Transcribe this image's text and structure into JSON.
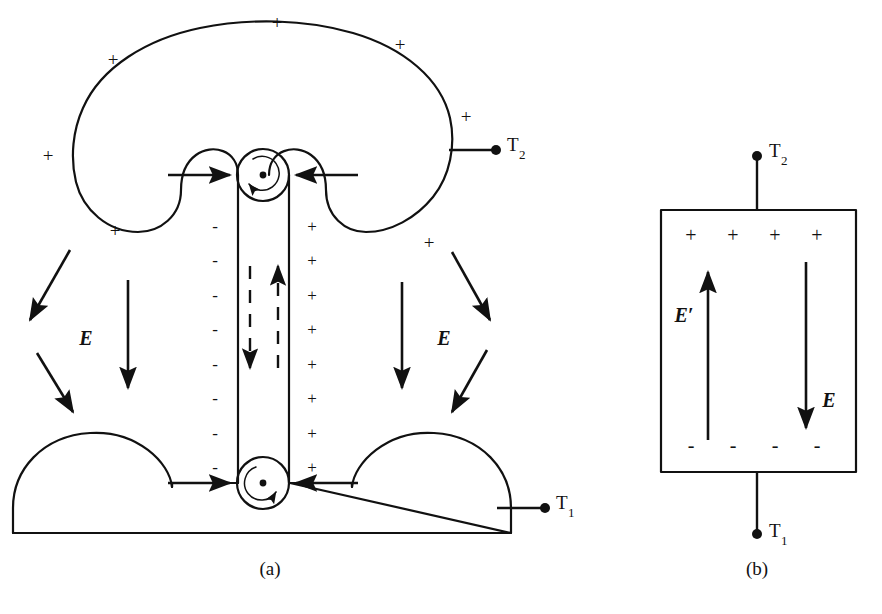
{
  "figure": {
    "background_color": "#ffffff",
    "ink_color": "#111111",
    "width": 882,
    "height": 614
  },
  "panels": [
    {
      "id": "a",
      "caption": "(a)",
      "caption_x": 270,
      "caption_y": 571,
      "description": "Van de Graaff generator: charged dome, belt on two pulleys, grounded base"
    },
    {
      "id": "b",
      "caption": "(b)",
      "caption_x": 757,
      "caption_y": 571,
      "description": "Equivalent rectangular source with internal field E and motional field E-prime"
    }
  ],
  "panel_a": {
    "dome_charges": [
      {
        "symbol": "+",
        "x": 277,
        "y": 25
      },
      {
        "symbol": "+",
        "x": 113,
        "y": 62
      },
      {
        "symbol": "+",
        "x": 400,
        "y": 47
      },
      {
        "symbol": "+",
        "x": 48,
        "y": 158
      },
      {
        "symbol": "+",
        "x": 466,
        "y": 119
      },
      {
        "symbol": "+",
        "x": 115,
        "y": 233
      },
      {
        "symbol": "+",
        "x": 429,
        "y": 245
      }
    ],
    "belt_left_charges": {
      "symbol": "-",
      "x": 215,
      "y_start": 228,
      "y_step": 34.5,
      "count": 8
    },
    "belt_right_charges": {
      "symbol": "+",
      "x": 312,
      "y_start": 228,
      "y_step": 34.5,
      "count": 8
    },
    "field_labels": [
      {
        "text": "E",
        "x": 86,
        "y": 340
      },
      {
        "text": "E",
        "x": 444,
        "y": 340
      }
    ],
    "terminals": [
      {
        "label": "T",
        "sub": "2",
        "dot_x": 496,
        "dot_y": 150,
        "text_x": 507,
        "text_y": 147,
        "lead_from_x": 449,
        "lead_from_y": 150
      },
      {
        "label": "T",
        "sub": "1",
        "dot_x": 545,
        "dot_y": 508,
        "text_x": 556,
        "text_y": 505,
        "lead_from_x": 496,
        "lead_from_y": 508
      }
    ],
    "pulleys": [
      {
        "name": "top-pulley",
        "cx": 263,
        "cy": 175,
        "r_outer": 26,
        "r_inner": 17,
        "rotation": "counter-clockwise"
      },
      {
        "name": "bottom-pulley",
        "cx": 263,
        "cy": 483,
        "r_outer": 26,
        "r_inner": 17,
        "rotation": "clockwise"
      }
    ],
    "belt_direction_labels": {
      "left_side": "down",
      "right_side": "up"
    },
    "comb_arrows": [
      {
        "name": "top-left-comb",
        "direction": "right",
        "y": 175
      },
      {
        "name": "top-right-comb",
        "direction": "left",
        "y": 175
      },
      {
        "name": "bottom-left-comb",
        "direction": "right",
        "y": 483
      },
      {
        "name": "bottom-right-comb",
        "direction": "left",
        "y": 483
      }
    ]
  },
  "panel_b": {
    "rect": {
      "x": 661,
      "y": 210,
      "width": 195,
      "height": 262
    },
    "top_charges": {
      "symbol": "+",
      "y": 237,
      "xs": [
        691,
        733,
        775,
        817
      ]
    },
    "bottom_charges": {
      "symbol": "-",
      "y": 447,
      "xs": [
        691,
        733,
        775,
        817
      ]
    },
    "arrows": [
      {
        "name": "e-prime-arrow",
        "direction": "up",
        "x": 708,
        "y_top": 268,
        "y_bottom": 440,
        "label": "E′",
        "label_x": 684,
        "label_y": 317
      },
      {
        "name": "e-arrow",
        "direction": "down",
        "x": 806,
        "y_top": 262,
        "y_bottom": 432,
        "label": "E",
        "label_x": 829,
        "label_y": 402
      }
    ],
    "terminals": [
      {
        "label": "T",
        "sub": "2",
        "dot_x": 757,
        "dot_y": 156,
        "text_x": 769,
        "text_y": 153,
        "lead_to_y": 210
      },
      {
        "label": "T",
        "sub": "1",
        "dot_x": 757,
        "dot_y": 534,
        "text_x": 769,
        "text_y": 533,
        "lead_to_y": 472
      }
    ]
  }
}
